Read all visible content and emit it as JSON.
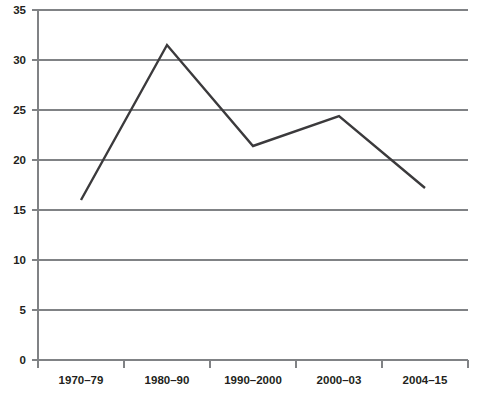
{
  "chart_data": {
    "type": "line",
    "title": "",
    "subtitle": "",
    "xlabel": "",
    "ylabel": "",
    "categories": [
      "1970–79",
      "1980–90",
      "1990–2000",
      "2000–03",
      "2004–15"
    ],
    "values": [
      16.0,
      31.5,
      21.4,
      24.4,
      17.2
    ],
    "series": [
      {
        "name": "",
        "values": [
          16.0,
          31.5,
          21.4,
          24.4,
          17.2
        ]
      }
    ],
    "ylim": [
      0,
      35
    ],
    "yticks": [
      0,
      5,
      10,
      15,
      20,
      25,
      30,
      35
    ],
    "ytick_labels": [
      "0",
      "5",
      "10",
      "15",
      "20",
      "25",
      "30",
      "35"
    ],
    "xtick_labels": [
      "1970–79",
      "1980–90",
      "1990–2000",
      "2000–03",
      "2004–15"
    ],
    "grid": true,
    "grid_axis": "y",
    "legend": false,
    "legend_position": "none",
    "line_color": "#3b3a3c",
    "grid_color": "#808285",
    "axis_color": "#808285",
    "text_color": "#231f20",
    "background_color": "#ffffff",
    "annotations": []
  },
  "layout": {
    "plot_left": 38,
    "plot_right": 468,
    "plot_top": 10,
    "plot_bottom": 360,
    "xtick_positions": [
      38,
      124,
      210,
      296,
      382,
      468
    ],
    "point_x_positions": [
      81,
      167,
      253,
      339,
      425
    ],
    "label_x_positions": [
      81,
      167,
      253,
      339,
      425
    ],
    "xlabel_y": 380
  }
}
